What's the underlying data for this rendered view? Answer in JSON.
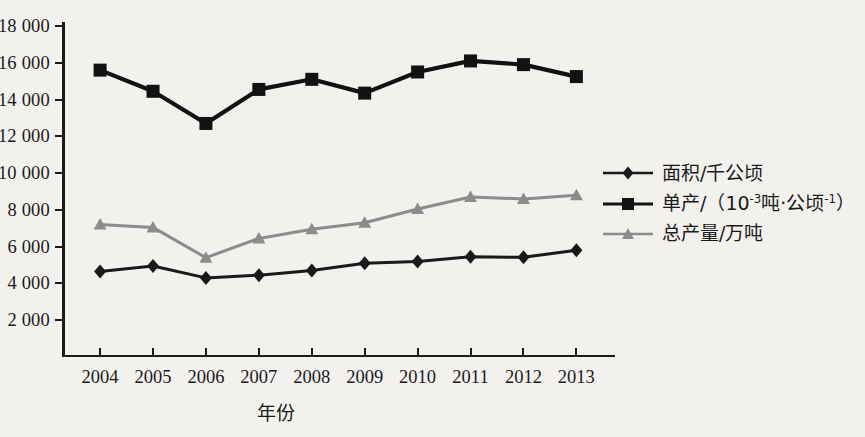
{
  "chart_data": {
    "type": "line",
    "title": "",
    "xlabel": "年份",
    "ylabel": "",
    "x": [
      "2004",
      "2005",
      "2006",
      "2007",
      "2008",
      "2009",
      "2010",
      "2011",
      "2012",
      "2013"
    ],
    "categories": [
      "2004",
      "2005",
      "2006",
      "2007",
      "2008",
      "2009",
      "2010",
      "2011",
      "2012",
      "2013"
    ],
    "ylim": [
      0,
      18000
    ],
    "y_ticks": [
      "2 000",
      "4 000",
      "6 000",
      "8 000",
      "10 000",
      "12 000",
      "14 000",
      "16 000",
      "18 000"
    ],
    "y_tick_values": [
      2000,
      4000,
      6000,
      8000,
      10000,
      12000,
      14000,
      16000,
      18000
    ],
    "grid": false,
    "legend_position": "right",
    "series": [
      {
        "name": "面积/千公顷",
        "marker": "diamond",
        "color": "#1a1a1a",
        "values": [
          4650,
          4950,
          4300,
          4450,
          4700,
          5100,
          5200,
          5450,
          5420,
          5800
        ]
      },
      {
        "name": "单产/（10⁻³吨·公顷⁻¹）",
        "name_base": "单产/（10",
        "name_sup1": "-3",
        "name_mid": "吨·公顷",
        "name_sup2": "-1",
        "name_end": "）",
        "marker": "square",
        "color": "#121212",
        "values": [
          15600,
          14450,
          12700,
          14550,
          15100,
          14350,
          15500,
          16100,
          15900,
          15250
        ]
      },
      {
        "name": "总产量/万吨",
        "marker": "triangle",
        "color": "#8c8c8c",
        "values": [
          7200,
          7050,
          5400,
          6450,
          6950,
          7300,
          8050,
          8700,
          8600,
          8800
        ]
      }
    ]
  },
  "legend": {
    "items": [
      {
        "label": "面积/千公顷"
      },
      {
        "label": "单产/（10⁻³吨·公顷⁻¹）"
      },
      {
        "label": "总产量/万吨"
      }
    ]
  },
  "axes": {
    "x_title": "年份"
  },
  "colors": {
    "background": "#f2f1ee",
    "ink": "#1a1a1a",
    "gray_series": "#8c8c8c"
  }
}
